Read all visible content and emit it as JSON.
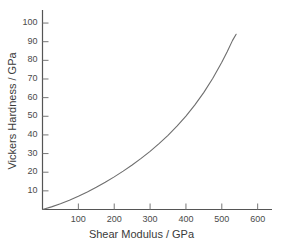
{
  "chart_data": {
    "type": "line",
    "title": "",
    "xlabel": "Shear Modulus / GPa",
    "ylabel": "Vickers Hardness / GPa",
    "xlim": [
      0,
      640
    ],
    "ylim": [
      0,
      107
    ],
    "grid": false,
    "legend": null,
    "xticks": [
      100,
      200,
      300,
      400,
      500,
      600
    ],
    "xtick_labels": [
      "100",
      "200",
      "300",
      "400",
      "500",
      "600"
    ],
    "yticks": [
      10,
      20,
      30,
      40,
      50,
      60,
      70,
      80,
      90,
      100
    ],
    "ytick_labels": [
      "10",
      "20",
      "30",
      "40",
      "50",
      "60",
      "70",
      "80",
      "90",
      "100"
    ],
    "series": [
      {
        "name": "Vickers hardness vs shear modulus",
        "color": "#6e6e6e",
        "x": [
          0,
          25,
          50,
          75,
          100,
          125,
          150,
          175,
          200,
          225,
          250,
          275,
          300,
          325,
          350,
          375,
          400,
          425,
          450,
          475,
          500,
          515,
          530,
          540
        ],
        "y": [
          0,
          1.4,
          3.1,
          5.0,
          7.1,
          9.4,
          11.9,
          14.6,
          17.5,
          20.6,
          23.9,
          27.4,
          31.2,
          35.3,
          39.8,
          44.7,
          50.1,
          56.1,
          62.8,
          70.4,
          79.0,
          84.6,
          90.7,
          94.0
        ]
      }
    ]
  },
  "axes": {
    "x_axis_name": "x-axis",
    "y_axis_name": "y-axis"
  }
}
